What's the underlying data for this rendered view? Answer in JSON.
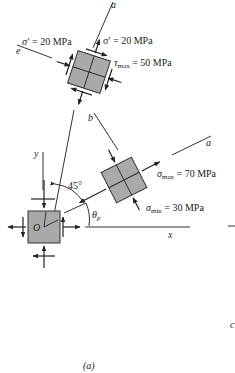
{
  "figure": {
    "caption": "(a)",
    "axes": {
      "x": "x",
      "y": "y",
      "origin": "O"
    },
    "axis_labels": {
      "a_top": "a",
      "e": "e",
      "b": "b",
      "a_right": "a",
      "c": "c"
    },
    "angles": {
      "deg45": "45°",
      "theta_p": "θ",
      "theta_p_sub": "p"
    },
    "top_element": {
      "sigma_prime_left": "σ′ = 20 MPa",
      "sigma_prime_right": "σ′ = 20 MPa",
      "tau_max_sym": "τ",
      "tau_max_sub": "max",
      "tau_max_val": " = 50 MPa"
    },
    "right_element": {
      "sigma_max_sym": "σ",
      "sigma_max_sub": "max",
      "sigma_max_val": " = 70 MPa",
      "sigma_min_sym": "σ",
      "sigma_min_sub": "min",
      "sigma_min_val": " = 30 MPa"
    }
  }
}
